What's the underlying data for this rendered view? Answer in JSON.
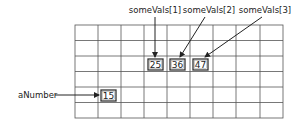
{
  "diagram": {
    "type": "memory-grid",
    "grid": {
      "columns": 9,
      "rows": 6
    },
    "cells": [
      {
        "name": "someVals[1]",
        "value": "25",
        "col": 3,
        "row": 2
      },
      {
        "name": "someVals[2]",
        "value": "36",
        "col": 4,
        "row": 2
      },
      {
        "name": "someVals[3]",
        "value": "47",
        "col": 5,
        "row": 2
      },
      {
        "name": "aNumber",
        "value": "15",
        "col": 1,
        "row": 4
      }
    ],
    "labels": {
      "someVals1": "someVals[1]",
      "someVals2": "someVals[2]",
      "someVals3": "someVals[3]",
      "aNumber": "aNumber"
    },
    "colors": {
      "line": "#444444",
      "text": "#222222",
      "background": "#ffffff"
    }
  }
}
